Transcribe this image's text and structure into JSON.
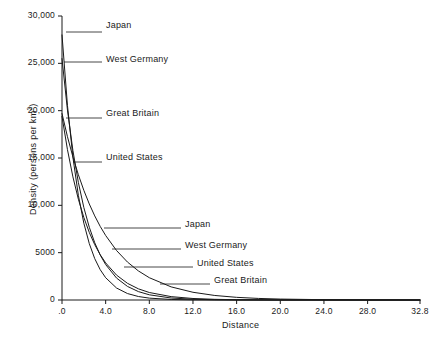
{
  "chart_data": {
    "type": "line",
    "title": "",
    "xlabel": "Distance",
    "ylabel": "Density (persons per km2)",
    "ylabel_base": "Density (persons per km",
    "ylabel_exponent": "2",
    "ylabel_suffix": ")",
    "xlim": [
      0,
      32.8
    ],
    "ylim": [
      0,
      30000
    ],
    "grid": false,
    "legend_position": "inline-callouts",
    "x_ticks": [
      {
        "value": 0,
        "label": ".0"
      },
      {
        "value": 4,
        "label": "4.0"
      },
      {
        "value": 8,
        "label": "8.0"
      },
      {
        "value": 12,
        "label": "12.0"
      },
      {
        "value": 16,
        "label": "16.0"
      },
      {
        "value": 20,
        "label": "20.0"
      },
      {
        "value": 24,
        "label": "24.0"
      },
      {
        "value": 28,
        "label": "28.0"
      },
      {
        "value": 32.8,
        "label": "32.8"
      }
    ],
    "y_ticks": [
      {
        "value": 0,
        "label": "0"
      },
      {
        "value": 5000,
        "label": "5000"
      },
      {
        "value": 10000,
        "label": "10,000"
      },
      {
        "value": 15000,
        "label": "15,000"
      },
      {
        "value": 20000,
        "label": "20,000"
      },
      {
        "value": 25000,
        "label": "25,000"
      },
      {
        "value": 30000,
        "label": "30,000"
      }
    ],
    "series": [
      {
        "name": "Japan",
        "intercept": 28000,
        "decay_rate": 0.62,
        "color": "#1a1a1a",
        "points": [
          {
            "x": 0.0,
            "y": 28000
          },
          {
            "x": 0.5,
            "y": 20550
          },
          {
            "x": 1.0,
            "y": 15080
          },
          {
            "x": 1.5,
            "y": 11060
          },
          {
            "x": 2.0,
            "y": 8115
          },
          {
            "x": 2.5,
            "y": 5955
          },
          {
            "x": 3.0,
            "y": 4368
          },
          {
            "x": 3.5,
            "y": 3205
          },
          {
            "x": 4.0,
            "y": 2352
          },
          {
            "x": 5.0,
            "y": 1266
          },
          {
            "x": 6.0,
            "y": 681
          },
          {
            "x": 7.0,
            "y": 367
          },
          {
            "x": 8.0,
            "y": 197
          },
          {
            "x": 10.0,
            "y": 57
          },
          {
            "x": 12.0,
            "y": 17
          },
          {
            "x": 14.0,
            "y": 5
          },
          {
            "x": 16.0,
            "y": 1
          },
          {
            "x": 20.0,
            "y": 0
          },
          {
            "x": 32.8,
            "y": 0
          }
        ]
      },
      {
        "name": "West Germany",
        "intercept": 25500,
        "decay_rate": 0.48,
        "color": "#1a1a1a",
        "points": [
          {
            "x": 0.0,
            "y": 25500
          },
          {
            "x": 0.5,
            "y": 20060
          },
          {
            "x": 1.0,
            "y": 15780
          },
          {
            "x": 1.5,
            "y": 12415
          },
          {
            "x": 2.0,
            "y": 9768
          },
          {
            "x": 2.5,
            "y": 7684
          },
          {
            "x": 3.0,
            "y": 6046
          },
          {
            "x": 3.5,
            "y": 4757
          },
          {
            "x": 4.0,
            "y": 3742
          },
          {
            "x": 5.0,
            "y": 2316
          },
          {
            "x": 6.0,
            "y": 1433
          },
          {
            "x": 7.0,
            "y": 887
          },
          {
            "x": 8.0,
            "y": 549
          },
          {
            "x": 10.0,
            "y": 210
          },
          {
            "x": 12.0,
            "y": 80
          },
          {
            "x": 14.0,
            "y": 31
          },
          {
            "x": 16.0,
            "y": 12
          },
          {
            "x": 20.0,
            "y": 2
          },
          {
            "x": 24.0,
            "y": 0
          },
          {
            "x": 32.8,
            "y": 0
          }
        ]
      },
      {
        "name": "United States",
        "intercept": 19400,
        "decay_rate": 0.4,
        "color": "#1a1a1a",
        "points": [
          {
            "x": 0.0,
            "y": 19400
          },
          {
            "x": 0.5,
            "y": 15880
          },
          {
            "x": 1.0,
            "y": 13003
          },
          {
            "x": 1.5,
            "y": 10647
          },
          {
            "x": 2.0,
            "y": 8718
          },
          {
            "x": 2.5,
            "y": 7138
          },
          {
            "x": 3.0,
            "y": 5844
          },
          {
            "x": 3.5,
            "y": 4785
          },
          {
            "x": 4.0,
            "y": 3917
          },
          {
            "x": 5.0,
            "y": 2625
          },
          {
            "x": 6.0,
            "y": 1760
          },
          {
            "x": 7.0,
            "y": 1180
          },
          {
            "x": 8.0,
            "y": 791
          },
          {
            "x": 10.0,
            "y": 355
          },
          {
            "x": 12.0,
            "y": 160
          },
          {
            "x": 14.0,
            "y": 72
          },
          {
            "x": 16.0,
            "y": 32
          },
          {
            "x": 20.0,
            "y": 6
          },
          {
            "x": 24.0,
            "y": 1
          },
          {
            "x": 32.8,
            "y": 0
          }
        ]
      },
      {
        "name": "Great Britain",
        "intercept": 19700,
        "decay_rate": 0.265,
        "color": "#1a1a1a",
        "points": [
          {
            "x": 0.0,
            "y": 19700
          },
          {
            "x": 0.5,
            "y": 17250
          },
          {
            "x": 1.0,
            "y": 15110
          },
          {
            "x": 1.5,
            "y": 13230
          },
          {
            "x": 2.0,
            "y": 11585
          },
          {
            "x": 2.5,
            "y": 10145
          },
          {
            "x": 3.0,
            "y": 8883
          },
          {
            "x": 3.5,
            "y": 7779
          },
          {
            "x": 4.0,
            "y": 6812
          },
          {
            "x": 5.0,
            "y": 5223
          },
          {
            "x": 6.0,
            "y": 4005
          },
          {
            "x": 7.0,
            "y": 3071
          },
          {
            "x": 8.0,
            "y": 2355
          },
          {
            "x": 10.0,
            "y": 1385
          },
          {
            "x": 12.0,
            "y": 815
          },
          {
            "x": 14.0,
            "y": 479
          },
          {
            "x": 16.0,
            "y": 282
          },
          {
            "x": 18.0,
            "y": 166
          },
          {
            "x": 20.0,
            "y": 98
          },
          {
            "x": 24.0,
            "y": 34
          },
          {
            "x": 28.0,
            "y": 12
          },
          {
            "x": 32.8,
            "y": 3
          }
        ]
      }
    ],
    "callouts": [
      {
        "label": "Japan",
        "text_x": 106,
        "text_y": 20,
        "line_x1": 66,
        "line_y1": 32,
        "line_x2": 102,
        "line_y2": 32,
        "elbow_y": 32
      },
      {
        "label": "West Germany",
        "text_x": 106,
        "text_y": 54,
        "line_x1": 64,
        "line_y1": 62,
        "line_x2": 102,
        "line_y2": 62,
        "elbow_y": 62
      },
      {
        "label": "Great Britain",
        "text_x": 106,
        "text_y": 108,
        "line_x1": 66,
        "line_y1": 118,
        "line_x2": 102,
        "line_y2": 118,
        "elbow_y": 118
      },
      {
        "label": "United States",
        "text_x": 106,
        "text_y": 152,
        "line_x1": 73,
        "line_y1": 162,
        "line_x2": 102,
        "line_y2": 162,
        "elbow_y": 162
      },
      {
        "label": "Japan",
        "text_x": 185,
        "text_y": 219,
        "line_x1": 104,
        "line_y1": 228,
        "line_x2": 181,
        "line_y2": 228,
        "elbow_y": 228
      },
      {
        "label": "West Germany",
        "text_x": 185,
        "text_y": 240,
        "line_x1": 112,
        "line_y1": 249,
        "line_x2": 181,
        "line_y2": 249,
        "elbow_y": 249
      },
      {
        "label": "United States",
        "text_x": 197,
        "text_y": 258,
        "line_x1": 124,
        "line_y1": 267,
        "line_x2": 193,
        "line_y2": 267,
        "elbow_y": 267
      },
      {
        "label": "Great Britain",
        "text_x": 214,
        "text_y": 275,
        "line_x1": 160,
        "line_y1": 284,
        "line_x2": 210,
        "line_y2": 284,
        "elbow_y": 284
      }
    ],
    "axis_geometry": {
      "left": 62,
      "right": 420,
      "top": 16,
      "bottom": 300,
      "tick_length": 4,
      "line_color": "#1a1a1a",
      "line_width": 1
    }
  }
}
